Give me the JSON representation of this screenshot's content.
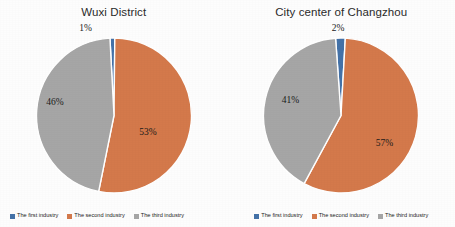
{
  "chart_data": [
    {
      "type": "pie",
      "title": "Wuxi District",
      "categories": [
        "The first industry",
        "The second industry",
        "The third industry"
      ],
      "values": [
        1,
        53,
        46
      ],
      "labels": [
        "1%",
        "53%",
        "46%"
      ],
      "colors": [
        "#4472a8",
        "#d4794b",
        "#a6a6a6"
      ],
      "legend_position": "bottom",
      "start_angle_deg": -3,
      "direction": "clockwise"
    },
    {
      "type": "pie",
      "title": "City center of Changzhou",
      "categories": [
        "The first industry",
        "The second industry",
        "The third industry"
      ],
      "values": [
        2,
        57,
        41
      ],
      "labels": [
        "2%",
        "57%",
        "41%"
      ],
      "colors": [
        "#4472a8",
        "#d4794b",
        "#a6a6a6"
      ],
      "legend_position": "bottom",
      "start_angle_deg": -4,
      "direction": "clockwise"
    }
  ],
  "left_chart": {
    "title": "Wuxi District",
    "slices": [
      {
        "label": "1%",
        "name": "The first industry",
        "value": 1,
        "color": "#4472a8"
      },
      {
        "label": "53%",
        "name": "The second industry",
        "value": 53,
        "color": "#d4794b"
      },
      {
        "label": "46%",
        "name": "The third industry",
        "value": 46,
        "color": "#a6a6a6"
      }
    ],
    "legend": [
      {
        "label": "The first industry",
        "color": "#4472a8"
      },
      {
        "label": "The second industry",
        "color": "#d4794b"
      },
      {
        "label": "The third industry",
        "color": "#a6a6a6"
      }
    ]
  },
  "right_chart": {
    "title": "City center of Changzhou",
    "slices": [
      {
        "label": "2%",
        "name": "The first industry",
        "value": 2,
        "color": "#4472a8"
      },
      {
        "label": "57%",
        "name": "The second industry",
        "value": 57,
        "color": "#d4794b"
      },
      {
        "label": "41%",
        "name": "The third industry",
        "value": 41,
        "color": "#a6a6a6"
      }
    ],
    "legend": [
      {
        "label": "The first industry",
        "color": "#4472a8"
      },
      {
        "label": "The second industry",
        "color": "#d4794b"
      },
      {
        "label": "The third industry",
        "color": "#a6a6a6"
      }
    ]
  }
}
